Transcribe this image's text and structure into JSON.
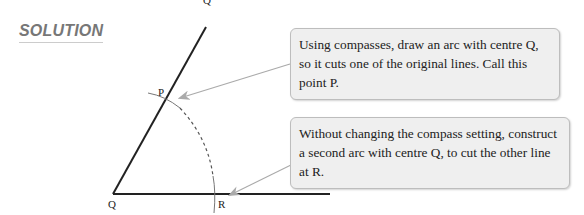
{
  "heading": "SOLUTION",
  "labels": {
    "top": "Q",
    "p": "P",
    "q": "Q",
    "r": "R"
  },
  "callouts": [
    {
      "text": "Using compasses, draw an arc with centre Q, so it cuts one of the original lines. Call this point P."
    },
    {
      "text": "Without changing the compass setting, construct a second arc with centre Q, to cut the other line at R."
    }
  ],
  "colors": {
    "line": "#222222",
    "arc": "#555555",
    "arrow": "#aaaaaa",
    "box_bg": "#efefef"
  }
}
